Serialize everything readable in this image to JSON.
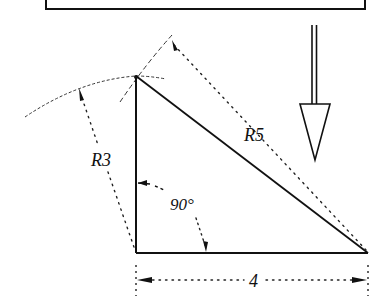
{
  "diagram": {
    "type": "geometry-construction",
    "labels": {
      "hypotenuse_radius": "R5",
      "vertical_radius": "R3",
      "right_angle": "90°",
      "base_length": "4"
    },
    "triangle": {
      "vertices": [
        [
          136,
          76
        ],
        [
          136,
          253
        ],
        [
          368,
          253
        ]
      ],
      "sides": {
        "vertical": 3,
        "base": 4,
        "hypotenuse": 5
      }
    },
    "colors": {
      "ink": "#111111",
      "background": "#ffffff"
    }
  }
}
